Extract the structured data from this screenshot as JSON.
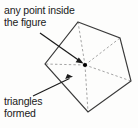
{
  "figure": {
    "type": "geometry-diagram",
    "shape_name": "pentagon",
    "background_color": "#fdfdfc",
    "outline_color": "#3a3a3a",
    "dashed_color": "#9a9a9a",
    "arrow_color": "#1a1a1a",
    "point_color": "#000000"
  },
  "annotations": {
    "top_label": {
      "line1": "any point inside",
      "line2": "the figure",
      "full_text": "any point inside the figure"
    },
    "bottom_label": {
      "line1": "triangles",
      "line2": "formed",
      "full_text": "triangles formed"
    }
  },
  "geometry": {
    "polygon_vertices": [
      {
        "x": 78,
        "y": 22
      },
      {
        "x": 120,
        "y": 38
      },
      {
        "x": 131,
        "y": 81
      },
      {
        "x": 88,
        "y": 112
      },
      {
        "x": 45,
        "y": 64
      }
    ],
    "interior_point": {
      "x": 85,
      "y": 65
    },
    "triangle_count": 5,
    "arrows": [
      {
        "name": "arrow-to-point",
        "x1": 40,
        "y1": 33,
        "x2": 83,
        "y2": 63
      },
      {
        "name": "arrow-to-triangle",
        "x1": 33,
        "y1": 96,
        "x2": 73,
        "y2": 76
      }
    ]
  }
}
